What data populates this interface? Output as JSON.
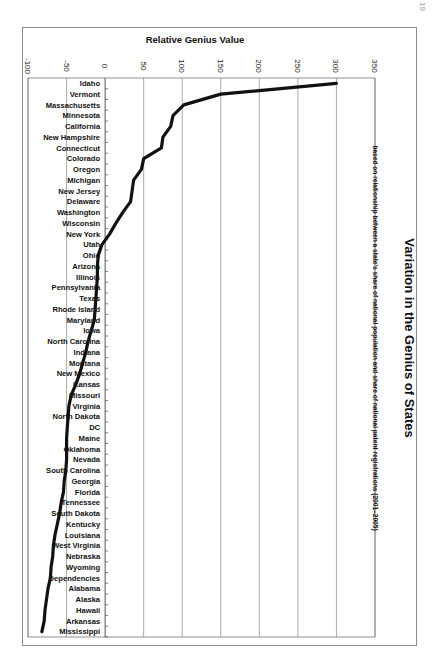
{
  "page": {
    "page_number": "19"
  },
  "chart_data": {
    "type": "line",
    "orientation": "rotated-90",
    "title": "Variation in the Genius of States",
    "subtitle": "based on relationship between a state's share of national population and share of national patent registrations (2001–2005)",
    "xlabel": "",
    "ylabel": "Relative Genius Value",
    "ylim": [
      -100,
      350
    ],
    "yticks": [
      -100,
      -50,
      0,
      50,
      100,
      150,
      200,
      250,
      300,
      350
    ],
    "grid": true,
    "legend": "none",
    "line_color": "#111111",
    "categories": [
      "Idaho",
      "Vermont",
      "Massachusetts",
      "Minnesota",
      "California",
      "New Hampshire",
      "Connecticut",
      "Colorado",
      "Oregon",
      "Michigan",
      "New Jersey",
      "Delaware",
      "Washington",
      "Wisconsin",
      "New York",
      "Utah",
      "Ohio",
      "Arizona",
      "Illinois",
      "Pennsylvania",
      "Texas",
      "Rhode Island",
      "Maryland",
      "Iowa",
      "North Carolina",
      "Indiana",
      "Montana",
      "New Mexico",
      "Kansas",
      "Missouri",
      "Virginia",
      "North Dakota",
      "DC",
      "Maine",
      "Oklahoma",
      "Nevada",
      "South Carolina",
      "Georgia",
      "Florida",
      "Tennessee",
      "South Dakota",
      "Kentucky",
      "Louisiana",
      "West Virginia",
      "Nebraska",
      "Wyoming",
      "Dependencies",
      "Alabama",
      "Alaska",
      "Hawaii",
      "Arkansas",
      "Mississippi"
    ],
    "values": [
      300,
      150,
      102,
      88,
      85,
      75,
      73,
      50,
      47,
      37,
      35,
      33,
      23,
      14,
      6,
      -4,
      -9,
      -10,
      -10,
      -11,
      -12,
      -13,
      -14,
      -18,
      -22,
      -25,
      -29,
      -33,
      -38,
      -44,
      -47,
      -48,
      -49,
      -50,
      -50,
      -50,
      -51,
      -53,
      -54,
      -57,
      -59,
      -62,
      -65,
      -67,
      -68,
      -70,
      -71,
      -74,
      -76,
      -78,
      -79,
      -82
    ]
  }
}
